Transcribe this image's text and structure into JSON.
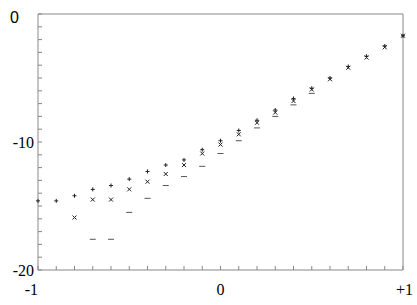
{
  "chart_data": {
    "type": "scatter",
    "title": "",
    "xlabel": "",
    "ylabel": "",
    "xlim": [
      -1,
      1
    ],
    "ylim": [
      -20,
      0
    ],
    "grid": false,
    "legend": null,
    "x_tick_labels": [
      {
        "value": -1,
        "label": "-1"
      },
      {
        "value": 0,
        "label": "0"
      },
      {
        "value": 1,
        "label": "+1"
      }
    ],
    "y_tick_labels": [
      {
        "value": 0,
        "label": "0"
      },
      {
        "value": -10,
        "label": "-10"
      },
      {
        "value": -20,
        "label": "-20"
      }
    ],
    "x_minor_ticks": 20,
    "y_minor_ticks": 20,
    "series": [
      {
        "name": "plus",
        "marker": "+",
        "x": [
          -1.0,
          -0.9,
          -0.8,
          -0.7,
          -0.6,
          -0.5,
          -0.4,
          -0.3,
          -0.2,
          -0.1,
          0.0,
          0.1,
          0.2,
          0.3,
          0.4,
          0.5,
          0.6,
          0.7,
          0.8,
          0.9,
          1.0
        ],
        "values": [
          -14.6,
          -14.6,
          -14.2,
          -13.7,
          -13.4,
          -12.9,
          -12.3,
          -11.8,
          -11.4,
          -10.6,
          -9.9,
          -9.1,
          -8.3,
          -7.5,
          -6.6,
          -5.8,
          -5.0,
          -4.1,
          -3.3,
          -2.5,
          -1.7
        ]
      },
      {
        "name": "cross",
        "marker": "×",
        "x": [
          -0.8,
          -0.7,
          -0.6,
          -0.5,
          -0.4,
          -0.3,
          -0.2,
          -0.1,
          0.0,
          0.1,
          0.2,
          0.3,
          0.4,
          0.5,
          0.6,
          0.7,
          0.8,
          0.9,
          1.0
        ],
        "values": [
          -15.9,
          -14.5,
          -14.5,
          -13.7,
          -13.1,
          -12.5,
          -11.8,
          -10.9,
          -10.2,
          -9.4,
          -8.5,
          -7.7,
          -6.8,
          -5.9,
          -5.1,
          -4.2,
          -3.4,
          -2.6,
          -1.7
        ]
      },
      {
        "name": "minus",
        "marker": "−",
        "x": [
          -0.7,
          -0.6,
          -0.5,
          -0.4,
          -0.3,
          -0.2,
          -0.1,
          0.0,
          0.1,
          0.2,
          0.3,
          0.4,
          0.5
        ],
        "values": [
          -17.6,
          -17.6,
          -15.5,
          -14.4,
          -13.4,
          -12.7,
          -11.9,
          -10.9,
          -9.9,
          -8.9,
          -8.0,
          -7.1,
          -6.2
        ]
      }
    ]
  }
}
